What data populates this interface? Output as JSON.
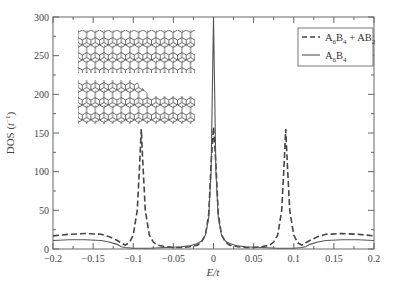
{
  "chart_data": {
    "type": "line",
    "title": "",
    "xlabel": "E/t",
    "ylabel": "DOS (t⁻¹)",
    "xlim": [
      -0.2,
      0.2
    ],
    "ylim": [
      0,
      300
    ],
    "x_ticks": [
      -0.2,
      -0.15,
      -0.1,
      -0.05,
      0,
      0.05,
      0.1,
      0.15,
      0.2
    ],
    "x_tick_labels": [
      "−0.2",
      "−0.15",
      "−0.1",
      "−0.05",
      "0",
      "0.05",
      "0.1",
      "0.15",
      "0.2"
    ],
    "y_ticks": [
      0,
      50,
      100,
      150,
      200,
      250,
      300
    ],
    "y_tick_labels": [
      "0",
      "50",
      "100",
      "150",
      "200",
      "250",
      "300"
    ],
    "grid": false,
    "legend_position": "upper right",
    "series": [
      {
        "name": "A6B4 + AB2",
        "label_main": "A",
        "label_parts": [
          [
            "A",
            "6"
          ],
          [
            "B",
            "4"
          ],
          [
            " + AB",
            "2"
          ]
        ],
        "style": "dashed",
        "color": "#444444",
        "x": [
          -0.2,
          -0.18,
          -0.16,
          -0.14,
          -0.13,
          -0.12,
          -0.115,
          -0.11,
          -0.105,
          -0.1,
          -0.095,
          -0.092,
          -0.09,
          -0.088,
          -0.085,
          -0.08,
          -0.075,
          -0.07,
          -0.06,
          -0.05,
          -0.04,
          -0.03,
          -0.02,
          -0.015,
          -0.01,
          -0.006,
          -0.003,
          0,
          0.003,
          0.006,
          0.01,
          0.015,
          0.02,
          0.03,
          0.04,
          0.05,
          0.06,
          0.07,
          0.075,
          0.08,
          0.085,
          0.088,
          0.09,
          0.092,
          0.095,
          0.1,
          0.105,
          0.11,
          0.115,
          0.12,
          0.13,
          0.14,
          0.16,
          0.18,
          0.2
        ],
        "values": [
          17,
          19,
          20,
          19,
          16,
          11,
          8,
          5,
          8,
          18,
          50,
          110,
          155,
          110,
          50,
          18,
          9,
          5,
          3,
          2,
          2,
          3,
          5,
          9,
          18,
          45,
          110,
          158,
          110,
          45,
          18,
          9,
          5,
          3,
          2,
          2,
          3,
          5,
          9,
          18,
          50,
          110,
          155,
          110,
          50,
          18,
          8,
          5,
          8,
          11,
          16,
          19,
          20,
          19,
          17
        ]
      },
      {
        "name": "A6B4",
        "label_parts": [
          [
            "A",
            "6"
          ],
          [
            "B",
            "4"
          ]
        ],
        "style": "solid",
        "color": "#555555",
        "x": [
          -0.2,
          -0.18,
          -0.16,
          -0.14,
          -0.13,
          -0.12,
          -0.115,
          -0.11,
          -0.1,
          -0.08,
          -0.06,
          -0.04,
          -0.03,
          -0.02,
          -0.015,
          -0.01,
          -0.006,
          -0.003,
          -0.0015,
          0,
          0.0015,
          0.003,
          0.006,
          0.01,
          0.015,
          0.02,
          0.03,
          0.04,
          0.06,
          0.08,
          0.1,
          0.11,
          0.115,
          0.12,
          0.13,
          0.14,
          0.16,
          0.18,
          0.2
        ],
        "values": [
          11,
          12,
          12,
          11,
          9,
          6,
          3,
          2,
          1,
          1,
          2,
          3,
          4,
          7,
          10,
          18,
          40,
          100,
          200,
          300,
          200,
          100,
          40,
          18,
          10,
          7,
          4,
          3,
          2,
          1,
          1,
          2,
          3,
          6,
          9,
          11,
          12,
          12,
          11
        ]
      }
    ],
    "annotations": [
      {
        "type": "inset-image",
        "description": "two hexagonal honeycomb lattice nanoribbons with a diagonal kink/junction",
        "position": "upper left"
      }
    ]
  }
}
